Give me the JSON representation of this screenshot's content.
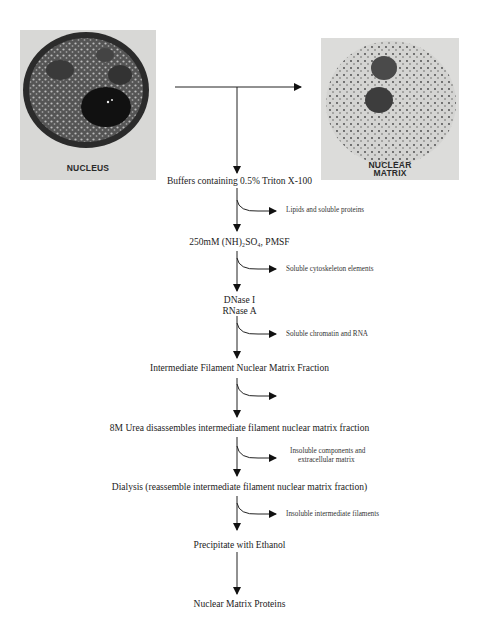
{
  "images": {
    "nucleus": {
      "label": "NUCLEUS"
    },
    "nuclear_matrix": {
      "label_line1": "NUCLEAR",
      "label_line2": "MATRIX"
    }
  },
  "steps": [
    "Buffers containing 0.5% Triton X-100",
    "250mM (NH)₂SO₄, PMSF",
    "DNase I",
    "RNase A",
    "Intermediate Filament Nuclear Matrix Fraction",
    "8M Urea disassembles intermediate filament nuclear matrix fraction",
    "Dialysis (reassemble intermediate filament nuclear matrix fraction)",
    "Precipitate with Ethanol",
    "Nuclear Matrix Proteins"
  ],
  "removed": [
    "Lipids and soluble proteins",
    "Soluble cytoskeleton elements",
    "Soluble chromatin and RNA",
    "",
    "Insoluble components and",
    "extracellular matrix",
    "Insoluble intermediate filaments"
  ]
}
